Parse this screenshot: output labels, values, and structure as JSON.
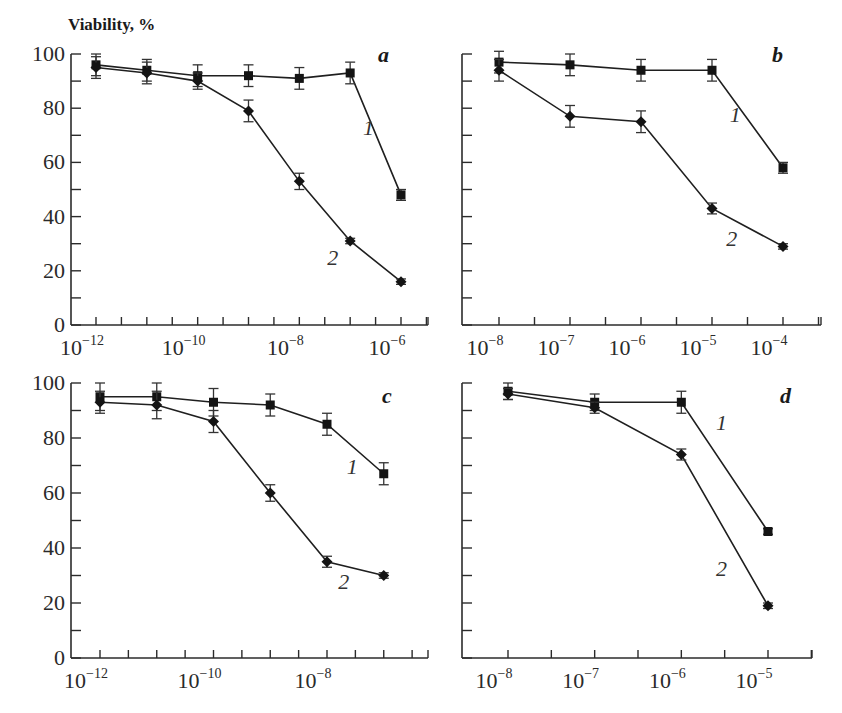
{
  "chart_data": [
    {
      "type": "line",
      "panel": "a",
      "title": "",
      "ylabel": "Viability, %",
      "xlabel": "",
      "xscale": "log",
      "xlim_exp": [
        -12.5,
        -5.75
      ],
      "ylim": [
        0,
        100
      ],
      "yticks": [
        0,
        20,
        40,
        60,
        80,
        100
      ],
      "yticks_minor": [
        10,
        30,
        50,
        70,
        90
      ],
      "show_ytick_labels": true,
      "xtick_labels": [
        {
          "base": "10",
          "exp": "−12",
          "e": -12
        },
        {
          "base": "10",
          "exp": "−10",
          "e": -10
        },
        {
          "base": "10",
          "exp": "−8",
          "e": -8
        },
        {
          "base": "10",
          "exp": "−6",
          "e": -6
        }
      ],
      "x_exp": [
        -12,
        -11,
        -10,
        -9,
        -8,
        -7,
        -6
      ],
      "series": [
        {
          "name": "1",
          "marker": "square",
          "values": [
            96,
            94,
            92,
            92,
            91,
            93,
            48
          ],
          "err": [
            4,
            4,
            4,
            4,
            4,
            4,
            2
          ],
          "label_pos": [
            -6.75,
            70
          ]
        },
        {
          "name": "2",
          "marker": "diamond",
          "values": [
            95,
            93,
            90,
            79,
            53,
            31,
            16
          ],
          "err": [
            4,
            4,
            3,
            4,
            3,
            1,
            1
          ],
          "label_pos": [
            -7.45,
            22
          ]
        }
      ]
    },
    {
      "type": "line",
      "panel": "b",
      "title": "",
      "ylabel": "",
      "xlabel": "",
      "xscale": "log",
      "xlim_exp": [
        -8.5,
        -3.5
      ],
      "ylim": [
        0,
        100
      ],
      "yticks": [
        0,
        20,
        40,
        60,
        80,
        100
      ],
      "yticks_minor": [
        10,
        30,
        50,
        70,
        90
      ],
      "show_ytick_labels": false,
      "xtick_labels": [
        {
          "base": "10",
          "exp": "−8",
          "e": -8
        },
        {
          "base": "10",
          "exp": "−7",
          "e": -7
        },
        {
          "base": "10",
          "exp": "−6",
          "e": -6
        },
        {
          "base": "10",
          "exp": "−5",
          "e": -5
        },
        {
          "base": "10",
          "exp": "−4",
          "e": -4
        }
      ],
      "x_exp": [
        -8,
        -7,
        -6,
        -5,
        -4
      ],
      "series": [
        {
          "name": "1",
          "marker": "square",
          "values": [
            97,
            96,
            94,
            94,
            58
          ],
          "err": [
            4,
            4,
            4,
            4,
            2
          ],
          "label_pos": [
            -4.75,
            75
          ]
        },
        {
          "name": "2",
          "marker": "diamond",
          "values": [
            94,
            77,
            75,
            43,
            29
          ],
          "err": [
            4,
            4,
            4,
            2,
            1
          ],
          "label_pos": [
            -4.8,
            29
          ]
        }
      ]
    },
    {
      "type": "line",
      "panel": "c",
      "title": "",
      "ylabel": "",
      "xlabel": "",
      "xscale": "log",
      "xlim_exp": [
        -12.5,
        -6.5
      ],
      "ylim": [
        0,
        100
      ],
      "yticks": [
        0,
        20,
        40,
        60,
        80,
        100
      ],
      "yticks_minor": [
        10,
        30,
        50,
        70,
        90
      ],
      "show_ytick_labels": true,
      "xtick_labels": [
        {
          "base": "10",
          "exp": "−12",
          "e": -12
        },
        {
          "base": "10",
          "exp": "−10",
          "e": -10
        },
        {
          "base": "10",
          "exp": "−8",
          "e": -8
        }
      ],
      "x_exp": [
        -12,
        -11,
        -10,
        -9,
        -8,
        -7
      ],
      "series": [
        {
          "name": "1",
          "marker": "square",
          "values": [
            95,
            95,
            93,
            92,
            85,
            67
          ],
          "err": [
            5,
            5,
            5,
            4,
            4,
            4
          ],
          "label_pos": [
            -7.65,
            67
          ]
        },
        {
          "name": "2",
          "marker": "diamond",
          "values": [
            93,
            92,
            86,
            60,
            35,
            30
          ],
          "err": [
            4,
            5,
            4,
            3,
            2,
            1
          ],
          "label_pos": [
            -7.8,
            25
          ]
        }
      ]
    },
    {
      "type": "line",
      "panel": "d",
      "title": "",
      "ylabel": "",
      "xlabel": "",
      "xscale": "log",
      "xlim_exp": [
        -8.5,
        -4.75
      ],
      "ylim": [
        0,
        100
      ],
      "yticks": [
        0,
        20,
        40,
        60,
        80,
        100
      ],
      "yticks_minor": [
        10,
        30,
        50,
        70,
        90
      ],
      "show_ytick_labels": false,
      "xtick_labels": [
        {
          "base": "10",
          "exp": "−8",
          "e": -8
        },
        {
          "base": "10",
          "exp": "−7",
          "e": -7
        },
        {
          "base": "10",
          "exp": "−6",
          "e": -6
        },
        {
          "base": "10",
          "exp": "−5",
          "e": -5
        }
      ],
      "x_exp": [
        -8,
        -7,
        -6,
        -5
      ],
      "series": [
        {
          "name": "1",
          "marker": "square",
          "values": [
            97,
            93,
            93,
            46
          ],
          "err": [
            3,
            3,
            4,
            1
          ],
          "label_pos": [
            -5.6,
            83
          ]
        },
        {
          "name": "2",
          "marker": "diamond",
          "values": [
            96,
            91,
            74,
            19
          ],
          "err": [
            2,
            2,
            2,
            1
          ],
          "label_pos": [
            -5.6,
            30
          ]
        }
      ]
    }
  ]
}
